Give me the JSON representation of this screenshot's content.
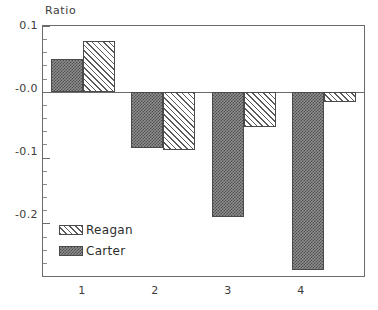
{
  "chart_data": {
    "type": "bar",
    "title": "",
    "subtitle": "",
    "xlabel": "",
    "ylabel": "Ratio",
    "categories": [
      "1",
      "2",
      "3",
      "4"
    ],
    "series": [
      {
        "name": "Reagan",
        "values": [
          0.077,
          -0.088,
          -0.053,
          -0.015
        ]
      },
      {
        "name": "Carter",
        "values": [
          0.05,
          -0.085,
          -0.19,
          -0.27
        ]
      }
    ],
    "ylim": [
      -0.28,
      0.1
    ],
    "ytick_labels": [
      "0.1",
      "-0.0",
      "-0.1",
      "-0.2"
    ],
    "ytick_values": [
      0.1,
      0.0,
      -0.1,
      -0.2
    ],
    "minor_ticks_per_interval": 4,
    "grid": false,
    "legend_position": "inside-bottom-left",
    "zero_line": true,
    "legend": [
      {
        "label": "Reagan",
        "pattern": "diagonal-hatch",
        "color": "#5a5a5a"
      },
      {
        "label": "Carter",
        "pattern": "dark-checker",
        "color": "#4f4f4f"
      }
    ]
  },
  "axes": {
    "y_label": "Ratio",
    "y_ticks": [
      {
        "label": "0.1"
      },
      {
        "label": "-0.0"
      },
      {
        "label": "-0.1"
      },
      {
        "label": "-0.2"
      }
    ],
    "x_ticks": [
      {
        "label": "1"
      },
      {
        "label": "2"
      },
      {
        "label": "3"
      },
      {
        "label": "4"
      }
    ]
  },
  "legend": {
    "items": [
      {
        "label": "Reagan"
      },
      {
        "label": "Carter"
      }
    ]
  }
}
